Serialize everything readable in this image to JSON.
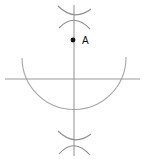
{
  "figure": {
    "background_color": "#ffffff",
    "width": 146,
    "height": 159,
    "stroke_color": "#9a9a9a",
    "arc_color": "#a0a0a0",
    "point_color": "#111111",
    "label_color": "#111111"
  },
  "labels": {
    "point_a": "A"
  },
  "geometry": {
    "vertical_line": {
      "name": "vertical-line",
      "x": 74,
      "y1": 5,
      "y2": 156
    },
    "horizontal_line": {
      "name": "horizontal-line",
      "y": 79,
      "x1": 5,
      "x2": 140
    },
    "main_arc": {
      "name": "main-arc",
      "center_x": 74,
      "center_y": 57,
      "radius": 52,
      "start_x": 22,
      "start_y": 58,
      "end_x": 126,
      "end_y": 57,
      "lowest_y": 98
    },
    "point_a": {
      "name": "point-a",
      "x": 73,
      "y": 40,
      "radius": 2.4,
      "label_x": 82,
      "label_y": 43
    },
    "top_cross": {
      "name": "top-arc-cross",
      "center_x": 74,
      "center_y": 17,
      "arc1": {
        "x1": 58,
        "y1": 6,
        "cx": 74,
        "cy": 20,
        "x2": 91,
        "y2": 9
      },
      "arc2": {
        "x1": 59,
        "y1": 27,
        "cx": 74,
        "cy": 13,
        "x2": 90,
        "y2": 28
      }
    },
    "bottom_cross": {
      "name": "bottom-arc-cross",
      "center_x": 74,
      "center_y": 142,
      "arc1": {
        "x1": 58,
        "y1": 131,
        "cx": 74,
        "cy": 145,
        "x2": 91,
        "y2": 134
      },
      "arc2": {
        "x1": 59,
        "y1": 153,
        "cx": 74,
        "cy": 138,
        "x2": 90,
        "y2": 153
      }
    }
  }
}
